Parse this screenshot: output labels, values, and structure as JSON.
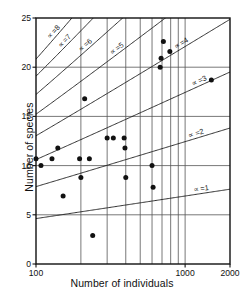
{
  "chart_data": {
    "type": "scatter",
    "title": "",
    "xlabel": "Number of individuals",
    "ylabel": "Number of species",
    "xscale": "log",
    "yscale": "linear",
    "xlim": [
      100,
      2000
    ],
    "ylim": [
      0,
      25
    ],
    "grid": true,
    "xticks": [
      100,
      1000,
      2000
    ],
    "xticklabels": [
      "100",
      "1000",
      "2000"
    ],
    "x_gridlines": [
      200,
      300,
      400,
      500,
      600,
      700,
      800,
      900,
      1000
    ],
    "yticks": [
      0,
      5,
      10,
      15,
      20,
      25
    ],
    "yticklabels": [
      "0",
      "5",
      "10",
      "15",
      "20",
      "25"
    ],
    "y_gridlines": [
      5,
      10,
      15,
      20
    ],
    "points": [
      {
        "x": 100,
        "y": 10.7
      },
      {
        "x": 108,
        "y": 10.0
      },
      {
        "x": 128,
        "y": 10.7
      },
      {
        "x": 140,
        "y": 11.8
      },
      {
        "x": 152,
        "y": 6.9
      },
      {
        "x": 196,
        "y": 10.7
      },
      {
        "x": 200,
        "y": 8.8
      },
      {
        "x": 212,
        "y": 16.8
      },
      {
        "x": 228,
        "y": 10.7
      },
      {
        "x": 240,
        "y": 2.9
      },
      {
        "x": 300,
        "y": 12.8
      },
      {
        "x": 330,
        "y": 12.8
      },
      {
        "x": 390,
        "y": 12.8
      },
      {
        "x": 395,
        "y": 11.8
      },
      {
        "x": 400,
        "y": 8.8
      },
      {
        "x": 600,
        "y": 10.0
      },
      {
        "x": 610,
        "y": 7.8
      },
      {
        "x": 680,
        "y": 20.0
      },
      {
        "x": 690,
        "y": 20.9
      },
      {
        "x": 715,
        "y": 22.6
      },
      {
        "x": 790,
        "y": 21.6
      },
      {
        "x": 1500,
        "y": 18.7
      }
    ],
    "series": [
      {
        "name": "alpha-1",
        "alpha": 1,
        "label": "∝ =1"
      },
      {
        "name": "alpha-2",
        "alpha": 2,
        "label": "∝ =2"
      },
      {
        "name": "alpha-3",
        "alpha": 3,
        "label": "∝ =3"
      },
      {
        "name": "alpha-4",
        "alpha": 4,
        "label": "∝ =4"
      },
      {
        "name": "alpha-5",
        "alpha": 5,
        "label": "∝ =5"
      },
      {
        "name": "alpha-6",
        "alpha": 6,
        "label": "∝ =6"
      },
      {
        "name": "alpha-7",
        "alpha": 7,
        "label": "∝ =7"
      },
      {
        "name": "alpha-8",
        "alpha": 8,
        "label": "∝ =8"
      }
    ],
    "annotations": [
      "∝ =1",
      "∝ =2",
      "∝ =3",
      "∝ =4",
      "∝ =5",
      "∝ =6",
      "∝ =7",
      "∝ =8"
    ],
    "colors": {
      "line": "#1a1a1a",
      "grid": "#555555",
      "point": "#111111",
      "axis": "#111111",
      "background": "#ffffff"
    }
  }
}
